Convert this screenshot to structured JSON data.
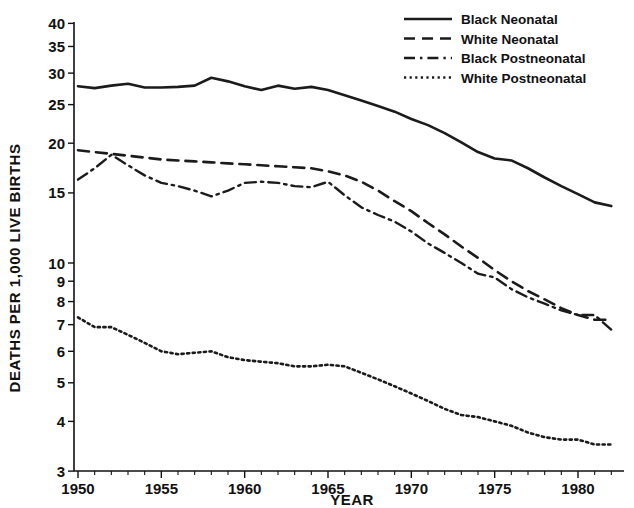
{
  "chart_data": {
    "type": "line",
    "title": "",
    "xlabel": "YEAR",
    "ylabel": "DEATHS PER 1,000 LIVE BIRTHS",
    "yscale": "log",
    "ylim": [
      3,
      40
    ],
    "xlim": [
      1950,
      1982
    ],
    "grid": false,
    "legend_position": "top-right",
    "ytick_labels": [
      "3",
      "4",
      "5",
      "6",
      "7",
      "8",
      "9",
      "10",
      "15",
      "20",
      "25",
      "30",
      "35",
      "40"
    ],
    "yticks": [
      3,
      4,
      5,
      6,
      7,
      8,
      9,
      10,
      15,
      20,
      25,
      30,
      35,
      40
    ],
    "xtick_labels": [
      "1950",
      "1955",
      "1960",
      "1965",
      "1970",
      "1975",
      "1980"
    ],
    "xticks": [
      1950,
      1955,
      1960,
      1965,
      1970,
      1975,
      1980
    ],
    "x": [
      1950,
      1951,
      1952,
      1953,
      1954,
      1955,
      1956,
      1957,
      1958,
      1959,
      1960,
      1961,
      1962,
      1963,
      1964,
      1965,
      1966,
      1967,
      1968,
      1969,
      1970,
      1971,
      1972,
      1973,
      1974,
      1975,
      1976,
      1977,
      1978,
      1979,
      1980,
      1981,
      1982
    ],
    "series": [
      {
        "name": "Black Neonatal",
        "style": "solid",
        "color": "#1b1b1b",
        "values": [
          27.8,
          27.5,
          27.9,
          28.2,
          27.6,
          27.6,
          27.7,
          27.9,
          29.2,
          28.6,
          27.8,
          27.2,
          27.9,
          27.4,
          27.7,
          27.2,
          26.4,
          25.6,
          24.8,
          24.0,
          23.0,
          22.2,
          21.2,
          20.1,
          19.0,
          18.3,
          18.1,
          17.3,
          16.4,
          15.6,
          14.9,
          14.2,
          13.9
        ]
      },
      {
        "name": "White Neonatal",
        "style": "dashed",
        "color": "#1b1b1b",
        "values": [
          19.2,
          19.0,
          18.8,
          18.6,
          18.4,
          18.2,
          18.1,
          18.0,
          17.9,
          17.8,
          17.7,
          17.6,
          17.5,
          17.4,
          17.3,
          17.0,
          16.6,
          16.0,
          15.2,
          14.3,
          13.5,
          12.6,
          11.8,
          11.0,
          10.3,
          9.6,
          9.0,
          8.5,
          8.1,
          7.7,
          7.4,
          7.2,
          7.2
        ]
      },
      {
        "name": "Black Postneonatal",
        "style": "dashdot",
        "color": "#1b1b1b",
        "values": [
          16.2,
          17.3,
          18.7,
          17.6,
          16.6,
          15.9,
          15.6,
          15.2,
          14.7,
          15.2,
          15.9,
          16.0,
          15.9,
          15.6,
          15.5,
          16.0,
          14.8,
          13.8,
          13.2,
          12.7,
          12.0,
          11.2,
          10.6,
          10.0,
          9.4,
          9.2,
          8.6,
          8.2,
          7.9,
          7.6,
          7.4,
          7.4,
          6.8
        ]
      },
      {
        "name": "White Postneonatal",
        "style": "dotted",
        "color": "#1b1b1b",
        "values": [
          7.3,
          6.9,
          6.9,
          6.6,
          6.3,
          6.0,
          5.9,
          5.95,
          6.0,
          5.8,
          5.7,
          5.65,
          5.6,
          5.5,
          5.5,
          5.55,
          5.5,
          5.3,
          5.1,
          4.9,
          4.7,
          4.5,
          4.3,
          4.15,
          4.1,
          4.0,
          3.9,
          3.75,
          3.65,
          3.6,
          3.6,
          3.5,
          3.5
        ]
      }
    ]
  },
  "legend": {
    "items": [
      {
        "label": "Black Neonatal",
        "style": "solid"
      },
      {
        "label": "White Neonatal",
        "style": "dashed"
      },
      {
        "label": "Black Postneonatal",
        "style": "dashdot"
      },
      {
        "label": "White Postneonatal",
        "style": "dotted"
      }
    ]
  },
  "axes": {
    "y_title": "DEATHS PER 1,000 LIVE BIRTHS",
    "x_title": "YEAR"
  }
}
